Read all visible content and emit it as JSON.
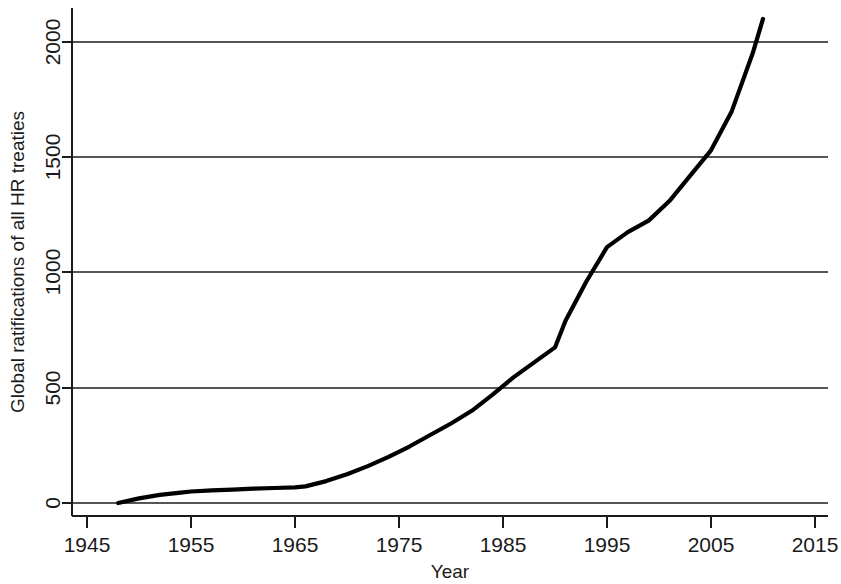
{
  "chart_data": {
    "type": "line",
    "title": "",
    "xlabel": "Year",
    "ylabel": "Global ratifications of all HR treaties",
    "xlim": [
      1945,
      2015
    ],
    "ylim": [
      0,
      2100
    ],
    "xticks": [
      1945,
      1955,
      1965,
      1975,
      1985,
      1995,
      2005,
      2015
    ],
    "xtick_labels": [
      "1945",
      "1955",
      "1965",
      "1975",
      "1985",
      "1995",
      "2005",
      "2015"
    ],
    "yticks": [
      0,
      500,
      1000,
      1500,
      2000
    ],
    "ytick_labels": [
      "0",
      "500",
      "1000",
      "1500",
      "2000"
    ],
    "grid": "horizontal",
    "legend": "none",
    "line_color": "#000000",
    "grid_color": "#555555",
    "series": [
      {
        "name": "Global ratifications of all HR treaties",
        "x": [
          1948,
          1950,
          1952,
          1954,
          1955,
          1957,
          1959,
          1961,
          1963,
          1965,
          1966,
          1968,
          1970,
          1972,
          1974,
          1976,
          1978,
          1980,
          1982,
          1984,
          1986,
          1988,
          1990,
          1991,
          1993,
          1995,
          1997,
          1999,
          2001,
          2003,
          2005,
          2007,
          2009,
          2010
        ],
        "y": [
          0,
          20,
          35,
          45,
          50,
          55,
          58,
          62,
          65,
          68,
          72,
          95,
          125,
          160,
          200,
          245,
          295,
          345,
          400,
          470,
          545,
          610,
          675,
          790,
          960,
          1110,
          1175,
          1225,
          1310,
          1420,
          1530,
          1700,
          1950,
          2100
        ]
      }
    ]
  },
  "axes": {
    "ylabel": "Global ratifications of all HR treaties",
    "xlabel": "Year"
  }
}
